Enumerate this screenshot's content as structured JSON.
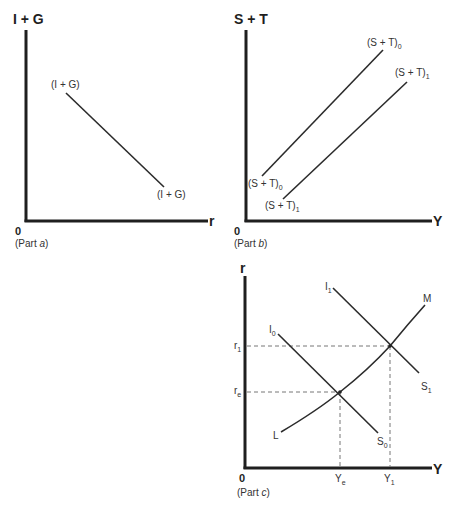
{
  "part_a": {
    "y_axis_label": "I + G",
    "x_axis_label": "r",
    "origin_label": "0",
    "caption_prefix": "(Part ",
    "caption_letter": "a",
    "caption_suffix": ")",
    "curve_top_label": "(I + G)",
    "curve_bottom_label": "(I + G)"
  },
  "part_b": {
    "y_axis_label": "S + T",
    "x_axis_label": "Y",
    "origin_label": "0",
    "caption_prefix": "(Part ",
    "caption_letter": "b",
    "caption_suffix": ")",
    "curve0_top_label": "(S + T)",
    "curve0_top_sub": "0",
    "curve1_top_label": "(S + T)",
    "curve1_top_sub": "1",
    "curve0_bottom_label": "(S + T)",
    "curve0_bottom_sub": "0",
    "curve1_bottom_label": "(S + T)",
    "curve1_bottom_sub": "1"
  },
  "part_c": {
    "y_axis_label": "r",
    "x_axis_label": "Y",
    "origin_label": "0",
    "caption_prefix": "(Part ",
    "caption_letter": "c",
    "caption_suffix": ")",
    "I0_label": "I",
    "I0_sub": "0",
    "I1_label": "I",
    "I1_sub": "1",
    "S0_label": "S",
    "S0_sub": "0",
    "S1_label": "S",
    "S1_sub": "1",
    "L_label": "L",
    "M_label": "M",
    "r1_label": "r",
    "r1_sub": "1",
    "re_label": "r",
    "re_sub": "e",
    "Ye_label": "Y",
    "Ye_sub": "e",
    "Y1_label": "Y",
    "Y1_sub": "1"
  }
}
